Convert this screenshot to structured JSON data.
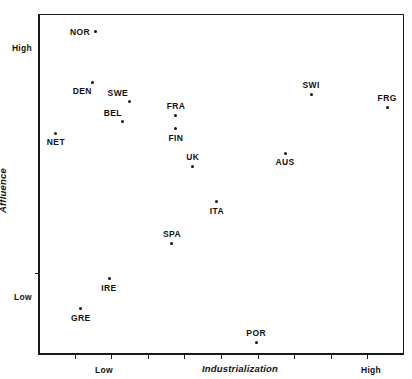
{
  "chart_data": {
    "type": "scatter",
    "title": "",
    "xlabel": "Industrialization",
    "ylabel": "Affluence",
    "grid": false,
    "legend": "none",
    "xlim": [
      0,
      100
    ],
    "ylim": [
      0,
      100
    ],
    "x_tick_labels": [
      {
        "text": "Low",
        "x": 18
      },
      {
        "text": "High",
        "x": 91
      }
    ],
    "y_tick_labels": [
      {
        "text": "High",
        "y": 90
      },
      {
        "text": "Low",
        "y": 17
      }
    ],
    "x_tick_count": 9,
    "y_tick_count": 1,
    "marker_color": "#111111",
    "axis_color": "#1a1a1a",
    "points": [
      {
        "label": "NOR",
        "x": 15.6,
        "y": 95.0,
        "label_pos": "left"
      },
      {
        "label": "DEN",
        "x": 15.0,
        "y": 79.8,
        "label_pos": "below-left"
      },
      {
        "label": "SWE",
        "x": 24.9,
        "y": 74.2,
        "label_pos": "above-left"
      },
      {
        "label": "BEL",
        "x": 23.2,
        "y": 68.6,
        "label_pos": "above-left"
      },
      {
        "label": "NET",
        "x": 4.9,
        "y": 65.1,
        "label_pos": "below"
      },
      {
        "label": "FRA",
        "x": 37.7,
        "y": 70.1,
        "label_pos": "above"
      },
      {
        "label": "FIN",
        "x": 37.7,
        "y": 66.3,
        "label_pos": "below"
      },
      {
        "label": "UK",
        "x": 42.3,
        "y": 55.4,
        "label_pos": "above"
      },
      {
        "label": "SWI",
        "x": 74.6,
        "y": 76.5,
        "label_pos": "above"
      },
      {
        "label": "FRG",
        "x": 95.4,
        "y": 72.7,
        "label_pos": "above"
      },
      {
        "label": "AUS",
        "x": 67.5,
        "y": 59.2,
        "label_pos": "below"
      },
      {
        "label": "ITA",
        "x": 48.9,
        "y": 44.9,
        "label_pos": "below"
      },
      {
        "label": "SPA",
        "x": 36.6,
        "y": 32.6,
        "label_pos": "above"
      },
      {
        "label": "IRE",
        "x": 19.4,
        "y": 22.3,
        "label_pos": "below"
      },
      {
        "label": "GRE",
        "x": 11.7,
        "y": 13.5,
        "label_pos": "below"
      },
      {
        "label": "POR",
        "x": 59.6,
        "y": 3.8,
        "label_pos": "above"
      }
    ]
  }
}
